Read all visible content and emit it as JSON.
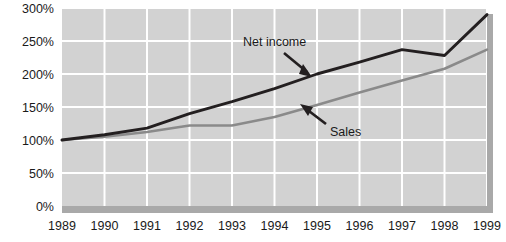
{
  "chart_data": {
    "type": "line",
    "title": "",
    "subtitle": "",
    "xlabel": "",
    "ylabel": "",
    "categories": [
      "1989",
      "1990",
      "1991",
      "1992",
      "1993",
      "1994",
      "1995",
      "1996",
      "1997",
      "1998",
      "1999"
    ],
    "x": [
      1989,
      1990,
      1991,
      1992,
      1993,
      1994,
      1995,
      1996,
      1997,
      1998,
      1999
    ],
    "series": [
      {
        "name": "Net income",
        "color": "#231f20",
        "values": [
          100,
          108,
          118,
          140,
          158,
          178,
          200,
          218,
          237,
          228,
          290
        ]
      },
      {
        "name": "Sales",
        "color": "#8a8a8a",
        "values": [
          100,
          105,
          112,
          122,
          122,
          135,
          153,
          172,
          190,
          208,
          237
        ]
      }
    ],
    "ylim": [
      0,
      300
    ],
    "yticks": [
      0,
      50,
      100,
      150,
      200,
      250,
      300
    ],
    "ytick_labels": [
      "0%",
      "50%",
      "100%",
      "150%",
      "200%",
      "250%",
      "300%"
    ],
    "xlim": [
      1989,
      1999
    ],
    "grid": true,
    "grid_color": "#ffffff",
    "plot_background": "#d2d2d2",
    "legend": "annotations",
    "annotations": [
      {
        "name": "Net income",
        "label": "Net income",
        "points_to_series": "Net income",
        "arrow": "down-right"
      },
      {
        "name": "Sales",
        "label": "Sales",
        "points_to_series": "Sales",
        "arrow": "up-left"
      }
    ]
  },
  "axes": {
    "y_labels": [
      "300%",
      "250%",
      "200%",
      "150%",
      "100%",
      "50%",
      "0%"
    ],
    "x_labels": [
      "1989",
      "1990",
      "1991",
      "1992",
      "1993",
      "1994",
      "1995",
      "1996",
      "1997",
      "1998",
      "1999"
    ]
  },
  "annotations": {
    "net_income_label": "Net income",
    "sales_label": "Sales"
  },
  "colors": {
    "net_income": "#231f20",
    "sales": "#8a8a8a",
    "plot_bg": "#d2d2d2",
    "grid": "#ffffff",
    "shadow": "#a8a8a8",
    "text": "#1a1a1a"
  }
}
